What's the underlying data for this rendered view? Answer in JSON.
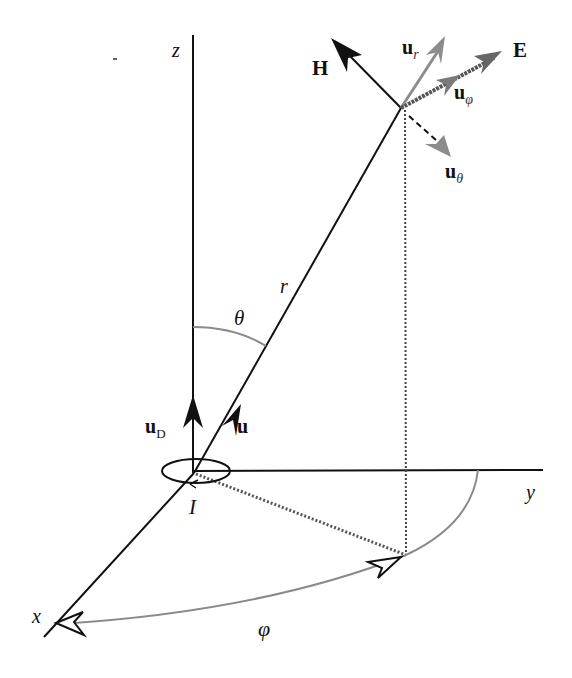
{
  "figure": {
    "colors": {
      "axis": "#111111",
      "angle_arc": "#8a8a8a",
      "unit_vector_gray": "#8c8c8c",
      "e_field": "#555555",
      "h_field": "#111111",
      "dotted": "#444444"
    }
  },
  "labels": {
    "z_axis": "z",
    "x_axis": "x",
    "y_axis": "y",
    "radius": "r",
    "theta": "θ",
    "phi": "φ",
    "current": "I",
    "H_field": "H",
    "E_field": "E",
    "u_r": {
      "base": "u",
      "sub": "r"
    },
    "u_phi": {
      "base": "u",
      "sub": "φ"
    },
    "u_theta": {
      "base": "u",
      "sub": "θ"
    },
    "u_D": {
      "base": "u",
      "sub": "D"
    },
    "u": "u"
  }
}
